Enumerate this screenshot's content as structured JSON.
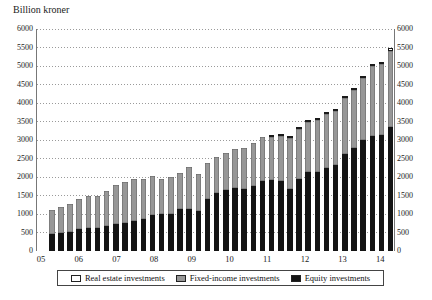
{
  "title": "Billion kroner",
  "colors": {
    "equity": "#141414",
    "fixed_income": "#979797",
    "real_estate": "#ffffff",
    "grid": "#9a9a9a",
    "axis": "#777777"
  },
  "legend": [
    {
      "key": "real_estate",
      "label": "Real estate investments"
    },
    {
      "key": "fixed_income",
      "label": "Fixed-income investments"
    },
    {
      "key": "equity",
      "label": "Equity investments"
    }
  ],
  "chart_data": {
    "type": "bar",
    "stacked": true,
    "title": "Billion kroner",
    "ylabel": "Billion kroner",
    "ylim": [
      0,
      6000
    ],
    "y_ticks": [
      0,
      500,
      1000,
      1500,
      2000,
      2500,
      3000,
      3500,
      4000,
      4500,
      5000,
      5500,
      6000
    ],
    "grid": "dotted horizontal gridlines at every 500",
    "legend_position": "bottom",
    "x_year_labels": [
      "05",
      "06",
      "07",
      "08",
      "09",
      "10",
      "11",
      "12",
      "13",
      "14"
    ],
    "quarters": [
      "05Q1",
      "05Q2",
      "05Q3",
      "05Q4",
      "06Q1",
      "06Q2",
      "06Q3",
      "06Q4",
      "07Q1",
      "07Q2",
      "07Q3",
      "07Q4",
      "08Q1",
      "08Q2",
      "08Q3",
      "08Q4",
      "09Q1",
      "09Q2",
      "09Q3",
      "09Q4",
      "10Q1",
      "10Q2",
      "10Q3",
      "10Q4",
      "11Q1",
      "11Q2",
      "11Q3",
      "11Q4",
      "12Q1",
      "12Q2",
      "12Q3",
      "12Q4",
      "13Q1",
      "13Q2",
      "13Q3",
      "13Q4",
      "14Q1",
      "14Q2"
    ],
    "series": [
      {
        "key": "equity",
        "name": "Equity investments",
        "values": [
          450,
          475,
          525,
          585,
          610,
          610,
          670,
          725,
          765,
          815,
          860,
          960,
          995,
          1010,
          1125,
          1130,
          1080,
          1410,
          1560,
          1645,
          1710,
          1670,
          1770,
          1890,
          1920,
          1895,
          1665,
          1945,
          2135,
          2125,
          2250,
          2335,
          2615,
          2785,
          3000,
          3105,
          3125,
          3360
        ]
      },
      {
        "key": "fixed_income",
        "name": "Fixed-income investments",
        "values": [
          655,
          710,
          735,
          815,
          875,
          870,
          965,
          1060,
          1105,
          1125,
          1100,
          1060,
          950,
          980,
          995,
          1145,
          995,
          975,
          990,
          995,
          1055,
          1120,
          1140,
          1190,
          1175,
          1205,
          1380,
          1355,
          1350,
          1420,
          1460,
          1455,
          1525,
          1570,
          1675,
          1885,
          1925,
          2055
        ]
      },
      {
        "key": "real_estate",
        "name": "Real estate investments",
        "values": [
          0,
          0,
          0,
          0,
          0,
          0,
          0,
          0,
          0,
          0,
          0,
          0,
          0,
          0,
          0,
          0,
          0,
          0,
          0,
          0,
          0,
          0,
          0,
          0,
          5,
          10,
          10,
          10,
          10,
          15,
          10,
          25,
          40,
          40,
          40,
          50,
          60,
          65
        ]
      }
    ],
    "totals": [
      1105,
      1185,
      1260,
      1400,
      1485,
      1480,
      1635,
      1785,
      1870,
      1940,
      1960,
      2020,
      1945,
      1990,
      2120,
      2275,
      2075,
      2385,
      2550,
      2640,
      2765,
      2790,
      2910,
      3080,
      3100,
      3110,
      3055,
      3310,
      3495,
      3560,
      3720,
      3815,
      4180,
      4395,
      4715,
      5040,
      5110,
      5480
    ]
  }
}
